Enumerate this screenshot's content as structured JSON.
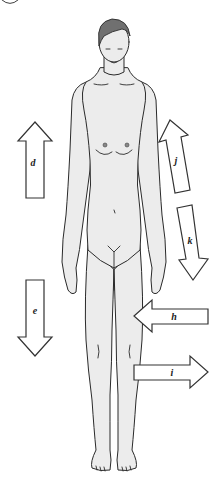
{
  "diagram": {
    "corner_marker": "partial circle (cropped label)",
    "arrows": [
      {
        "id": "d",
        "label": "d",
        "direction": "up",
        "position": "left side, upper"
      },
      {
        "id": "e",
        "label": "e",
        "direction": "down",
        "position": "left side, lower"
      },
      {
        "id": "j",
        "label": "j",
        "direction": "up-along-upper-arm",
        "position": "right side, along upper arm"
      },
      {
        "id": "k",
        "label": "k",
        "direction": "down-along-forearm",
        "position": "right side, along forearm"
      },
      {
        "id": "h",
        "label": "h",
        "direction": "left",
        "position": "right side, at thigh"
      },
      {
        "id": "i",
        "label": "i",
        "direction": "right",
        "position": "right side, at knee/lower leg"
      }
    ]
  },
  "colors": {
    "background": "#ffffff",
    "skin_fill": "#ececec",
    "outline": "#2a2a2a",
    "hair": "#707070",
    "arrow_fill": "#ffffff"
  }
}
